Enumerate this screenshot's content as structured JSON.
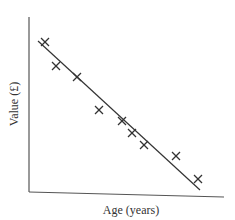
{
  "chart_data": {
    "type": "scatter",
    "title": "",
    "xlabel": "Age (years)",
    "ylabel": "Value (£)",
    "grid": false,
    "legend": null,
    "points_pixel": [
      {
        "x": 45,
        "y": 42
      },
      {
        "x": 56,
        "y": 66
      },
      {
        "x": 77,
        "y": 77
      },
      {
        "x": 99,
        "y": 110
      },
      {
        "x": 122,
        "y": 121
      },
      {
        "x": 132,
        "y": 133
      },
      {
        "x": 144,
        "y": 145
      },
      {
        "x": 176,
        "y": 156
      },
      {
        "x": 198,
        "y": 179
      }
    ],
    "points_relative": [
      {
        "x": 0.08,
        "y": 0.87
      },
      {
        "x": 0.14,
        "y": 0.74
      },
      {
        "x": 0.25,
        "y": 0.67
      },
      {
        "x": 0.36,
        "y": 0.49
      },
      {
        "x": 0.48,
        "y": 0.43
      },
      {
        "x": 0.53,
        "y": 0.36
      },
      {
        "x": 0.59,
        "y": 0.29
      },
      {
        "x": 0.76,
        "y": 0.23
      },
      {
        "x": 0.87,
        "y": 0.1
      }
    ],
    "trend_line": {
      "type": "linear",
      "slope_sign": "negative",
      "from": {
        "x": 38,
        "y": 41
      },
      "to": {
        "x": 200,
        "y": 190
      }
    },
    "marker": "x",
    "colors": {
      "line": "#333333",
      "marker": "#333333",
      "axis": "#555555"
    }
  }
}
